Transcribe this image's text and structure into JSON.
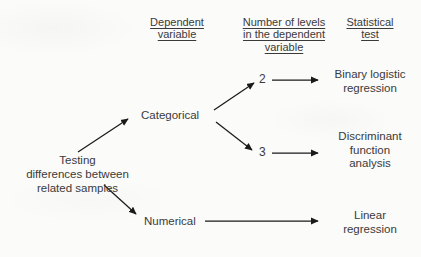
{
  "diagram": {
    "background_color": "#fbfbfa",
    "text_color": "#3a3a3a",
    "arrow_color": "#1a1a1a",
    "headers": [
      {
        "name": "dependent-variable",
        "line1": "Dependent",
        "line2": "variable",
        "line3": ""
      },
      {
        "name": "number-of-levels",
        "line1": "Number of levels",
        "line2": "in the dependent",
        "line3": "variable"
      },
      {
        "name": "statistical-test",
        "line1": "Statistical",
        "line2": "test",
        "line3": ""
      }
    ],
    "root": {
      "line1": "Testing",
      "line2": "differences between",
      "line3": "related samples"
    },
    "branches": [
      {
        "name": "categorical",
        "label": "Categorical"
      },
      {
        "name": "numerical",
        "label": "Numerical"
      }
    ],
    "levels": [
      {
        "name": "levels-2",
        "label": "2"
      },
      {
        "name": "levels-3",
        "label": "3"
      }
    ],
    "outcomes": [
      {
        "name": "binary-logistic-regression",
        "line1": "Binary logistic",
        "line2": "regression",
        "line3": ""
      },
      {
        "name": "discriminant-function-analysis",
        "line1": "Discriminant",
        "line2": "function",
        "line3": "analysis"
      },
      {
        "name": "linear-regression",
        "line1": "Linear",
        "line2": "regression",
        "line3": ""
      }
    ]
  }
}
